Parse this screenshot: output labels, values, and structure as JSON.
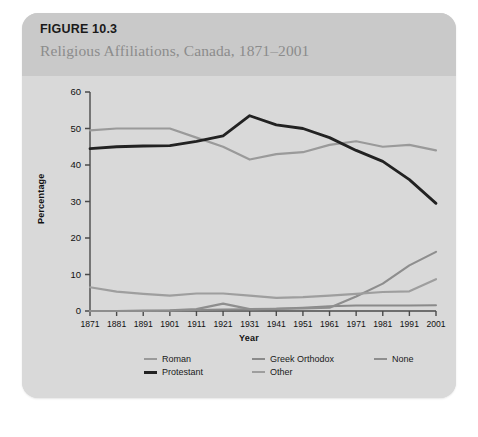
{
  "figure": {
    "number": "FIGURE 10.3",
    "title": "Religious Affiliations, Canada, 1871–2001"
  },
  "colors": {
    "card_background": "#d6d6d6",
    "header_background": "#c9c9c9",
    "plot_background": "#d9d9d9",
    "roman": "#9a9a9a",
    "protestant": "#222222",
    "greek_orthodox": "#8a8a8a",
    "none": "#8e8e8e",
    "other": "#9e9e9e",
    "axis": "#4a4a4a",
    "title_text": "#8c8c8c",
    "number_text": "#1a1a1a"
  },
  "legend": {
    "row1": [
      {
        "label": "Roman",
        "key": "roman"
      },
      {
        "label": "Greek Orthodox",
        "key": "greek_orthodox"
      },
      {
        "label": "None",
        "key": "none"
      }
    ],
    "row2": [
      {
        "label": "Protestant",
        "key": "protestant"
      },
      {
        "label": "Other",
        "key": "other"
      }
    ]
  },
  "chart_data": {
    "type": "line",
    "title": "Religious Affiliations, Canada, 1871–2001",
    "xlabel": "Year",
    "ylabel": "Percentage",
    "x": [
      1871,
      1881,
      1891,
      1901,
      1911,
      1921,
      1931,
      1941,
      1951,
      1961,
      1971,
      1981,
      1991,
      2001
    ],
    "xtick_labels": [
      "1871",
      "1881",
      "1891",
      "1901",
      "1911",
      "1921",
      "1931",
      "1941",
      "1951",
      "1961",
      "1971",
      "1981",
      "1991",
      "2001"
    ],
    "ytick_labels": [
      "0",
      "10",
      "20",
      "30",
      "40",
      "50",
      "60"
    ],
    "yticks": [
      0,
      10,
      20,
      30,
      40,
      50,
      60
    ],
    "ylim": [
      0,
      60
    ],
    "xlim": [
      1871,
      2001
    ],
    "grid": false,
    "legend_position": "bottom",
    "series": [
      {
        "name": "Roman",
        "color": "#9a9a9a",
        "width": 2.2,
        "values": [
          49.5,
          50.0,
          50.0,
          50.0,
          47.5,
          45.0,
          41.5,
          43.0,
          43.5,
          45.5,
          46.5,
          45.0,
          45.5,
          44.0
        ]
      },
      {
        "name": "Protestant",
        "color": "#222222",
        "width": 2.8,
        "values": [
          44.5,
          45.0,
          45.2,
          45.3,
          46.5,
          48.0,
          53.5,
          51.0,
          50.0,
          47.5,
          44.0,
          41.0,
          36.0,
          29.5
        ]
      },
      {
        "name": "Greek Orthodox",
        "color": "#8a8a8a",
        "width": 2.0,
        "values": [
          0.0,
          0.0,
          0.0,
          0.1,
          0.3,
          0.4,
          0.5,
          0.6,
          0.9,
          1.3,
          1.5,
          1.5,
          1.5,
          1.6
        ]
      },
      {
        "name": "None",
        "color": "#8e8e8e",
        "width": 2.2,
        "values": [
          0.0,
          0.0,
          0.1,
          0.2,
          0.5,
          2.0,
          0.5,
          0.6,
          0.7,
          0.9,
          4.0,
          7.5,
          12.5,
          16.2
        ]
      },
      {
        "name": "Other",
        "color": "#9e9e9e",
        "width": 2.2,
        "values": [
          6.5,
          5.3,
          4.7,
          4.2,
          4.8,
          4.8,
          4.2,
          3.6,
          3.8,
          4.2,
          4.7,
          5.2,
          5.4,
          8.7
        ]
      }
    ]
  }
}
